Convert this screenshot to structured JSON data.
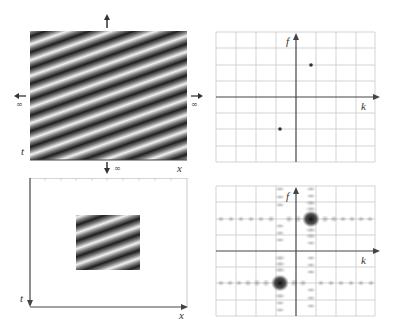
{
  "figure": {
    "panels": [
      {
        "id": "top-left",
        "description": "Infinite spatio-temporal sinusoidal grating (diagonal stripes)",
        "labels": {
          "vertical_axis": "t",
          "horizontal_axis": "x"
        },
        "extent_markers": {
          "left": "∞",
          "right": "∞",
          "bottom": "∞"
        }
      },
      {
        "id": "top-right",
        "description": "Fourier transform of infinite grating: two delta points",
        "labels": {
          "vertical_axis": "f",
          "horizontal_axis": "k"
        },
        "grid": {
          "cols": 8,
          "rows": 8
        },
        "points": [
          {
            "k": 0.75,
            "f": 1.6
          },
          {
            "k": -0.75,
            "f": -1.6
          }
        ]
      },
      {
        "id": "bottom-left",
        "description": "Windowed (finite) grating patch inside a blank field",
        "labels": {
          "vertical_axis": "t",
          "horizontal_axis": "x"
        }
      },
      {
        "id": "bottom-right",
        "description": "Fourier transform of windowed grating: sinc-spread blobs",
        "labels": {
          "vertical_axis": "f",
          "horizontal_axis": "k"
        },
        "grid": {
          "cols": 8,
          "rows": 8
        },
        "blobs": [
          {
            "k": 0.75,
            "f": 1.6
          },
          {
            "k": -0.75,
            "f": -1.6
          }
        ]
      }
    ]
  },
  "text": {
    "t": "t",
    "x": "x",
    "f": "f",
    "k": "k",
    "inf": "∞"
  }
}
